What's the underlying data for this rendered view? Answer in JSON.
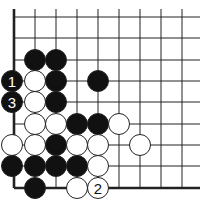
{
  "diagram": {
    "type": "go-board-fragment",
    "colors": {
      "background": "#ffffff",
      "line": "#222222",
      "black_stone": "#111111",
      "white_stone": "#ffffff",
      "stone_outline": "#222222"
    },
    "grid": {
      "columns_x": [
        12,
        35,
        56,
        77,
        98,
        119,
        140,
        161,
        182
      ],
      "rows_y": [
        17,
        38,
        60,
        81,
        102,
        124,
        145,
        166,
        188
      ],
      "line_right_end": 200,
      "line_top_start": 9,
      "edges": [
        "left",
        "bottom"
      ]
    },
    "stone_radius": 10.5,
    "stones": [
      {
        "color": "black",
        "col": 1,
        "row": 2,
        "label": ""
      },
      {
        "color": "black",
        "col": 2,
        "row": 2,
        "label": ""
      },
      {
        "color": "black",
        "col": 0,
        "row": 3,
        "label": "1"
      },
      {
        "color": "white",
        "col": 1,
        "row": 3,
        "label": ""
      },
      {
        "color": "black",
        "col": 2,
        "row": 3,
        "label": ""
      },
      {
        "color": "black",
        "col": 4,
        "row": 3,
        "label": ""
      },
      {
        "color": "black",
        "col": 0,
        "row": 4,
        "label": "3"
      },
      {
        "color": "white",
        "col": 1,
        "row": 4,
        "label": ""
      },
      {
        "color": "black",
        "col": 2,
        "row": 4,
        "label": ""
      },
      {
        "color": "white",
        "col": 1,
        "row": 5,
        "label": ""
      },
      {
        "color": "white",
        "col": 2,
        "row": 5,
        "label": ""
      },
      {
        "color": "black",
        "col": 3,
        "row": 5,
        "label": ""
      },
      {
        "color": "black",
        "col": 4,
        "row": 5,
        "label": ""
      },
      {
        "color": "white",
        "col": 5,
        "row": 5,
        "label": ""
      },
      {
        "color": "white",
        "col": 0,
        "row": 6,
        "label": ""
      },
      {
        "color": "white",
        "col": 1,
        "row": 6,
        "label": ""
      },
      {
        "color": "black",
        "col": 2,
        "row": 6,
        "label": ""
      },
      {
        "color": "white",
        "col": 3,
        "row": 6,
        "label": ""
      },
      {
        "color": "white",
        "col": 4,
        "row": 6,
        "label": ""
      },
      {
        "color": "white",
        "col": 6,
        "row": 6,
        "label": ""
      },
      {
        "color": "black",
        "col": 0,
        "row": 7,
        "label": ""
      },
      {
        "color": "black",
        "col": 1,
        "row": 7,
        "label": ""
      },
      {
        "color": "black",
        "col": 2,
        "row": 7,
        "label": ""
      },
      {
        "color": "black",
        "col": 3,
        "row": 7,
        "label": ""
      },
      {
        "color": "white",
        "col": 4,
        "row": 7,
        "label": ""
      },
      {
        "color": "black",
        "col": 1,
        "row": 8,
        "label": ""
      },
      {
        "color": "white",
        "col": 3,
        "row": 8,
        "label": ""
      },
      {
        "color": "white",
        "col": 4,
        "row": 8,
        "label": "2"
      }
    ]
  }
}
